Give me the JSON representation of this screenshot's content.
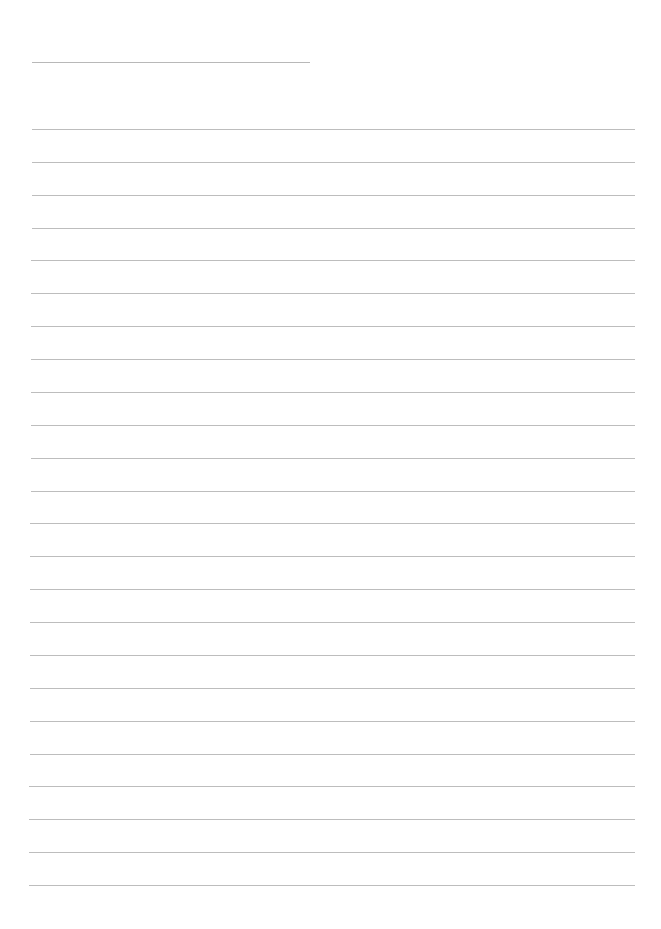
{
  "page": {
    "type": "blank lined writing sheet",
    "background": "#ffffff",
    "line_color": "#bdbdbd",
    "title_line": {
      "x": 32,
      "y": 62,
      "width": 278
    },
    "ruled_lines": {
      "count": 24,
      "first_y": 129,
      "last_y": 885,
      "left_top": 32,
      "left_bottom": 29,
      "right": 635
    }
  }
}
